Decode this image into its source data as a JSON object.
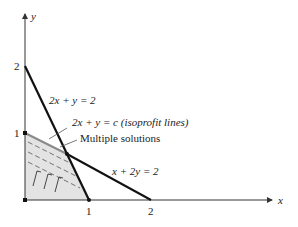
{
  "diagram": {
    "axes": {
      "x_label": "x",
      "y_label": "y",
      "x_ticks": [
        "1",
        "2"
      ],
      "y_ticks": [
        "1",
        "2"
      ]
    },
    "lines": [
      {
        "id": "constraint-1",
        "label": "2x + y = 2",
        "color": "#111111"
      },
      {
        "id": "constraint-2",
        "label": "x + 2y = 2",
        "color": "#111111"
      },
      {
        "id": "isoprofit",
        "label": "2x + y = c (isoprofit lines)",
        "color": "#777777"
      }
    ],
    "annotations": {
      "multiple_solutions": "Multiple solutions"
    },
    "feasible_region_color": "#e3e3e3"
  }
}
